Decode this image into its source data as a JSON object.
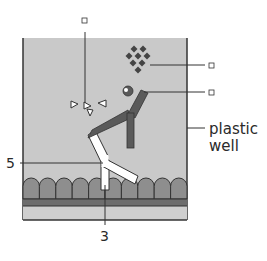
{
  "diagram": {
    "labels": {
      "top_box": "□",
      "enzyme_box": "□",
      "antibody_box": "□",
      "plastic_well_line1": "plastic",
      "plastic_well_line2": "well",
      "label_5": "5",
      "label_3": "3"
    },
    "components": {
      "well_fill": "plastic well interior",
      "cell_layer": "cell monolayer",
      "base_layer": "base layer",
      "substrate": "substrate molecules (triangles)",
      "enzyme": "enzyme cluster (diamonds)",
      "secondary_antibody": "enzyme-linked secondary antibody",
      "primary_antibody": "primary antibody"
    },
    "colors": {
      "well_fill": "#c9c9c9",
      "cell_fill": "#8e8e8e",
      "base_dark": "#6d6d6d",
      "base_light": "#c9c9c9",
      "secondary_antibody": "#5a5a5a",
      "primary_antibody": "#ffffff",
      "enzyme": "#444444",
      "outline": "#333333"
    }
  }
}
